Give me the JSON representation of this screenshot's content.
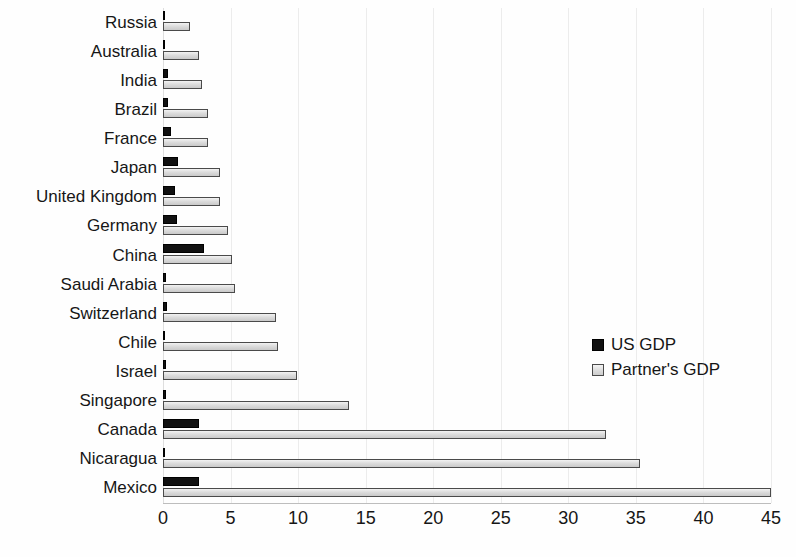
{
  "chart_data": {
    "type": "bar",
    "orientation": "horizontal",
    "title": "",
    "subtitle": "",
    "xlabel": "",
    "ylabel": "",
    "xlim": [
      0,
      45
    ],
    "ylim": null,
    "grid": true,
    "grid_axis": "x",
    "legend_position": "center-right",
    "xticks": [
      0,
      5,
      10,
      15,
      20,
      25,
      30,
      35,
      40,
      45
    ],
    "xtick_labels": [
      "0",
      "5",
      "10",
      "15",
      "20",
      "25",
      "30",
      "35",
      "40",
      "45"
    ],
    "categories": [
      "Russia",
      "Australia",
      "India",
      "Brazil",
      "France",
      "Japan",
      "United Kingdom",
      "Germany",
      "China",
      "Saudi Arabia",
      "Switzerland",
      "Chile",
      "Israel",
      "Singapore",
      "Canada",
      "Nicaragua",
      "Mexico"
    ],
    "series": [
      {
        "name": "US GDP",
        "color": "#111111",
        "values": [
          0.1,
          0.1,
          0.4,
          0.4,
          0.6,
          1.1,
          0.9,
          1.0,
          3.0,
          0.2,
          0.3,
          0.15,
          0.2,
          0.2,
          2.7,
          0.1,
          2.7
        ]
      },
      {
        "name": "Partner's GDP",
        "color": "#d8d8d8",
        "values": [
          2.0,
          2.7,
          2.9,
          3.3,
          3.3,
          4.2,
          4.2,
          4.8,
          5.1,
          5.3,
          8.4,
          8.5,
          9.9,
          13.8,
          32.8,
          35.3,
          45.0
        ]
      }
    ]
  },
  "legend": {
    "entries": [
      {
        "label": "US GDP",
        "swatch": "filled-black-square-icon"
      },
      {
        "label": "Partner's GDP",
        "swatch": "outlined-gray-square-icon"
      }
    ]
  }
}
